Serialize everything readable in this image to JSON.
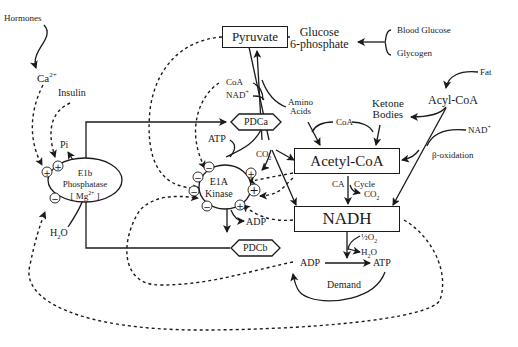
{
  "diagram": {
    "type": "metabolic-regulation-pathway",
    "nodes": {
      "hormones": "Hormones",
      "calcium": "Ca",
      "calcium_charge": "2+",
      "insulin": "Insulin",
      "pyruvate": "Pyruvate",
      "glucose6p_line1": "Glucose",
      "glucose6p_line2": "6-phosphate",
      "blood_glucose": "Blood Glucose",
      "glycogen": "Glycogen",
      "fat": "Fat",
      "acyl_coa": "Acyl-CoA",
      "nad_plus_right": "NAD",
      "nad_plus_right_charge": "+",
      "beta_oxidation": "β-oxidation",
      "ketone_line1": "Ketone",
      "ketone_line2": "Bodies",
      "coa_mid": "CoA",
      "amino_line1": "Amino",
      "amino_line2": "Acids",
      "coa_top": "CoA",
      "nad_top": "NAD",
      "nad_top_charge": "+",
      "pdca": "PDCa",
      "pdcb": "PDCb",
      "atp_left": "ATP",
      "co2_left": "CO",
      "co2_left_sub": "2",
      "acetyl_coa": "Acetyl-CoA",
      "ca_label": "CA",
      "cycle_label": "Cycle",
      "co2_right": "CO",
      "co2_right_sub": "2",
      "nadh": "NADH",
      "half_o2_frac": "½",
      "half_o2": "O",
      "half_o2_sub": "2",
      "h2o_right": "H",
      "h2o_right_sub": "2",
      "h2o_right_end": "O",
      "adp_bottom": "ADP",
      "atp_bottom": "ATP",
      "demand": "Demand",
      "e1a_line1": "E1A",
      "e1a_line2": "Kinase",
      "adp_kinase": "ADP",
      "e1b_line1": "E1b",
      "e1b_line2": "Phosphatase",
      "e1b_line3": "[ Mg",
      "e1b_line3_charge": "2+",
      "e1b_line3_end": " ]",
      "pi": "Pi",
      "h2o_left": "H",
      "h2o_left_sub": "2",
      "h2o_left_end": "O"
    },
    "signs": {
      "plus": "+",
      "minus": "−"
    }
  }
}
